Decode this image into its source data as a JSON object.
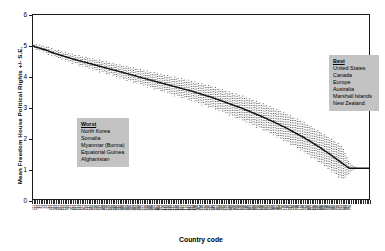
{
  "chart_data": {
    "type": "line",
    "title": "",
    "xlabel": "Country code",
    "ylabel": "Mean Freedom House Political Rights +/- S.E.",
    "ylim": [
      0,
      6
    ],
    "yticks": [
      0,
      1,
      2,
      3,
      4,
      5,
      6
    ],
    "grid": false,
    "legend_position": "none",
    "error_bars": "dotted +/- S.E. whiskers at each country code",
    "x_description": "Country codes, sorted by mean Freedom House Political Rights score (best to worst), 190 categories",
    "xticklabels": [
      "211",
      "231",
      "31",
      "17",
      "41",
      "1",
      "21",
      "71",
      "51",
      "11",
      "811",
      "221",
      "111",
      "311",
      "331",
      "411",
      "811",
      "121",
      "131",
      "155",
      "61",
      "91",
      "101",
      "141",
      "151",
      "161",
      "171",
      "181",
      "191",
      "201",
      "212",
      "222",
      "232",
      "242",
      "252",
      "255",
      "260",
      "265",
      "271",
      "281",
      "290",
      "305",
      "310",
      "316",
      "317",
      "325",
      "338",
      "339",
      "344",
      "345",
      "346",
      "349",
      "350",
      "352",
      "355",
      "359",
      "360",
      "365",
      "366",
      "367",
      "368",
      "369",
      "370",
      "371",
      "372",
      "373",
      "375",
      "380",
      "385",
      "390",
      "395",
      "402",
      "403",
      "404",
      "411",
      "420",
      "432",
      "433",
      "434",
      "435",
      "436",
      "437",
      "438",
      "439",
      "450",
      "451",
      "452",
      "461",
      "471",
      "475",
      "481",
      "482",
      "483",
      "484",
      "490",
      "500",
      "501",
      "510",
      "516",
      "517",
      "520",
      "522",
      "530",
      "531",
      "540",
      "541",
      "551",
      "552",
      "553",
      "560",
      "565",
      "570",
      "571",
      "572",
      "580",
      "581",
      "590",
      "600",
      "615",
      "616",
      "620",
      "625",
      "626",
      "630",
      "640",
      "645",
      "651",
      "652",
      "660",
      "663",
      "666",
      "670",
      "678",
      "680",
      "690",
      "692",
      "694",
      "696",
      "698",
      "700",
      "701",
      "702",
      "703",
      "704",
      "705",
      "710",
      "712",
      "713",
      "730",
      "731",
      "732",
      "740",
      "750",
      "760",
      "770",
      "771",
      "775",
      "780",
      "781",
      "790",
      "800",
      "811",
      "812",
      "816",
      "820",
      "830",
      "835",
      "840",
      "850",
      "860",
      "910",
      "920",
      "940",
      "946",
      "947",
      "950",
      "955",
      "970",
      "971",
      "972",
      "973",
      "983",
      "986",
      "987",
      "990"
    ],
    "series": [
      {
        "name": "Mean Freedom House Political Rights",
        "note": "Monotone decreasing step-like curve from ~5.0 at left axis to a flat floor at 1.0 from roughly the 88th percentile of country codes to the right edge",
        "values": [
          5.0,
          4.97,
          4.95,
          4.93,
          4.92,
          4.9,
          4.88,
          4.87,
          4.85,
          4.83,
          4.8,
          4.78,
          4.76,
          4.74,
          4.73,
          4.71,
          4.69,
          4.68,
          4.66,
          4.64,
          4.62,
          4.61,
          4.59,
          4.57,
          4.56,
          4.54,
          4.53,
          4.51,
          4.5,
          4.48,
          4.47,
          4.45,
          4.44,
          4.42,
          4.41,
          4.39,
          4.38,
          4.36,
          4.35,
          4.33,
          4.32,
          4.3,
          4.29,
          4.27,
          4.26,
          4.24,
          4.23,
          4.21,
          4.2,
          4.18,
          4.17,
          4.15,
          4.14,
          4.12,
          4.11,
          4.09,
          4.08,
          4.06,
          4.05,
          4.03,
          4.02,
          4.0,
          3.98,
          3.97,
          3.95,
          3.94,
          3.92,
          3.91,
          3.89,
          3.88,
          3.86,
          3.85,
          3.83,
          3.82,
          3.8,
          3.79,
          3.77,
          3.76,
          3.74,
          3.73,
          3.71,
          3.7,
          3.68,
          3.67,
          3.65,
          3.64,
          3.62,
          3.61,
          3.59,
          3.58,
          3.56,
          3.55,
          3.53,
          3.52,
          3.5,
          3.48,
          3.46,
          3.45,
          3.43,
          3.41,
          3.4,
          3.38,
          3.36,
          3.35,
          3.33,
          3.31,
          3.29,
          3.27,
          3.25,
          3.23,
          3.21,
          3.19,
          3.17,
          3.15,
          3.13,
          3.11,
          3.09,
          3.07,
          3.05,
          3.03,
          3.01,
          2.99,
          2.97,
          2.95,
          2.92,
          2.9,
          2.88,
          2.86,
          2.83,
          2.81,
          2.79,
          2.76,
          2.74,
          2.72,
          2.69,
          2.67,
          2.64,
          2.62,
          2.59,
          2.57,
          2.54,
          2.52,
          2.49,
          2.46,
          2.44,
          2.41,
          2.38,
          2.36,
          2.33,
          2.3,
          2.27,
          2.24,
          2.21,
          2.18,
          2.15,
          2.12,
          2.09,
          2.06,
          2.03,
          2.0,
          1.96,
          1.93,
          1.9,
          1.86,
          1.83,
          1.79,
          1.76,
          1.72,
          1.69,
          1.65,
          1.61,
          1.57,
          1.54,
          1.5,
          1.46,
          1.42,
          1.38,
          1.34,
          1.3,
          1.26,
          1.22,
          1.18,
          1.14,
          1.1,
          1.06,
          1.02,
          1.0,
          1.0,
          1.0,
          1.0,
          1.0,
          1.0,
          1.0,
          1.0,
          1.0,
          1.0,
          1.0,
          1.0
        ]
      }
    ],
    "standard_errors": [
      0.0,
      0.06,
      0.09,
      0.05,
      0.11,
      0.07,
      0.12,
      0.06,
      0.1,
      0.13,
      0.08,
      0.14,
      0.07,
      0.12,
      0.09,
      0.15,
      0.1,
      0.13,
      0.08,
      0.16,
      0.11,
      0.14,
      0.09,
      0.17,
      0.12,
      0.15,
      0.1,
      0.18,
      0.13,
      0.16,
      0.11,
      0.19,
      0.14,
      0.17,
      0.12,
      0.2,
      0.15,
      0.18,
      0.13,
      0.21,
      0.16,
      0.19,
      0.14,
      0.22,
      0.17,
      0.2,
      0.15,
      0.23,
      0.18,
      0.21,
      0.16,
      0.24,
      0.19,
      0.22,
      0.17,
      0.25,
      0.2,
      0.23,
      0.18,
      0.26,
      0.21,
      0.24,
      0.19,
      0.27,
      0.22,
      0.25,
      0.2,
      0.28,
      0.23,
      0.26,
      0.21,
      0.29,
      0.24,
      0.27,
      0.22,
      0.3,
      0.25,
      0.28,
      0.23,
      0.31,
      0.26,
      0.29,
      0.24,
      0.32,
      0.27,
      0.3,
      0.25,
      0.33,
      0.28,
      0.31,
      0.26,
      0.34,
      0.29,
      0.32,
      0.27,
      0.35,
      0.3,
      0.33,
      0.28,
      0.36,
      0.31,
      0.34,
      0.29,
      0.37,
      0.32,
      0.35,
      0.3,
      0.38,
      0.33,
      0.36,
      0.31,
      0.39,
      0.34,
      0.37,
      0.32,
      0.4,
      0.35,
      0.38,
      0.33,
      0.41,
      0.36,
      0.39,
      0.34,
      0.42,
      0.37,
      0.4,
      0.35,
      0.43,
      0.38,
      0.41,
      0.36,
      0.44,
      0.39,
      0.42,
      0.37,
      0.45,
      0.4,
      0.43,
      0.38,
      0.46,
      0.41,
      0.44,
      0.39,
      0.47,
      0.42,
      0.45,
      0.4,
      0.48,
      0.43,
      0.46,
      0.41,
      0.49,
      0.44,
      0.47,
      0.42,
      0.5,
      0.45,
      0.48,
      0.43,
      0.51,
      0.46,
      0.49,
      0.44,
      0.52,
      0.47,
      0.5,
      0.45,
      0.53,
      0.48,
      0.51,
      0.46,
      0.54,
      0.49,
      0.52,
      0.47,
      0.55,
      0.5,
      0.53,
      0.48,
      0.56,
      0.51,
      0.54,
      0.49,
      0.4,
      0.3,
      0.22,
      0.16,
      0.11,
      0.07,
      0.04,
      0.02,
      0.01,
      0.0,
      0.0,
      0.0
    ],
    "annotations": [
      {
        "id": "worst",
        "header": "Worst",
        "items": [
          "North Korea",
          "Somalia",
          "Myanmar (Burma)",
          "Equatorial Guinea",
          "Afghanistan"
        ]
      },
      {
        "id": "best",
        "header": "Best",
        "items": [
          "United States",
          "Canada",
          "Europe",
          "Australia",
          "Marshall Islands",
          "New Zealand"
        ]
      }
    ]
  }
}
